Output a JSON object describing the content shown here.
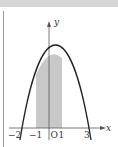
{
  "figure": {
    "axes": {
      "x_label": "x",
      "y_label": "y",
      "origin_label": "O"
    },
    "tick_labels": [
      "−2",
      "−1",
      "1",
      "3"
    ],
    "curve": {
      "description": "downward parabola through x=-2 and x=3",
      "equation": "y = -(x+2)(x-3)"
    },
    "shaded_region": {
      "from": -1,
      "to": 1,
      "color": "#c8c8c8"
    },
    "colors": {
      "curve": "#222222",
      "axis": "#555555",
      "shade": "#c8c8c8",
      "top_band": "#d6d6d6"
    }
  }
}
